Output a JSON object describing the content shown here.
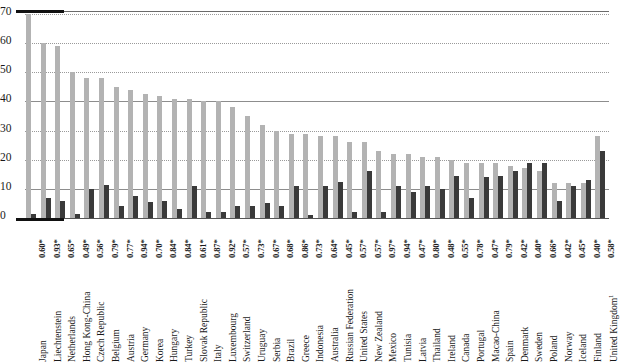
{
  "chart_data": {
    "type": "bar",
    "title": "",
    "xlabel": "",
    "ylabel": "",
    "ylim": [
      0,
      80
    ],
    "yticks": [
      0,
      10,
      20,
      30,
      40,
      50,
      60,
      70,
      80
    ],
    "grid": true,
    "legend_position": "none",
    "colors": {
      "light_series": "#b3b3b3",
      "dark_series": "#3a3a3a"
    },
    "categories": [
      "Japan",
      "Liechtenstein",
      "Netherlands",
      "Hong Kong-China",
      "Czech Republic",
      "Belgium",
      "Austria",
      "Germany",
      "Korea",
      "Hungary",
      "Turkey",
      "Slovak Republic",
      "Italy",
      "Luxembourg",
      "Switzerland",
      "Uruguay",
      "Serbia",
      "Brazil",
      "Greece",
      "Indonesia",
      "Australia",
      "Russian Federation",
      "United States",
      "New Zealand",
      "Mexico",
      "Tunisia",
      "Latvia",
      "Thailand",
      "Ireland",
      "Canada",
      "Portugal",
      "Macao-China",
      "Spain",
      "Denmark",
      "Sweden",
      "Poland",
      "Norway",
      "Iceland",
      "Finland",
      "United Kingdom"
    ],
    "category_superscripts": {
      "United Kingdom": "1"
    },
    "secondary_labels": [
      "0.60*",
      "0.93*",
      "0.65*",
      "0.49*",
      "0.56*",
      "0.79*",
      "0.77*",
      "0.94*",
      "0.70*",
      "0.84*",
      "0.84*",
      "0.61*",
      "0.87*",
      "0.92*",
      "0.57*",
      "0.73*",
      "0.67*",
      "0.68*",
      "0.86*",
      "0.73*",
      "0.64*",
      "0.45*",
      "0.57*",
      "0.57*",
      "0.97*",
      "0.94*",
      "0.47*",
      "0.80*",
      "0.48*",
      "0.55*",
      "0.78*",
      "0.47*",
      "0.79*",
      "0.42*",
      "0.40*",
      "0.66*",
      "0.42*",
      "0.45*",
      "0.40*",
      "0.58*"
    ],
    "series": [
      {
        "name": "light-series",
        "color": "#b3b3b3",
        "values": [
          70,
          60,
          59,
          50,
          48,
          48,
          45,
          44,
          42.5,
          42,
          41,
          41,
          40,
          40,
          38,
          35,
          32,
          30,
          29,
          29,
          28,
          28,
          26,
          26,
          23,
          22,
          22,
          21,
          21,
          20,
          19,
          19,
          19,
          18,
          17,
          16,
          12,
          12,
          12,
          28
        ]
      },
      {
        "name": "dark-series",
        "color": "#3a3a3a",
        "values": [
          1.5,
          7,
          6,
          1.5,
          10,
          11.5,
          4,
          7.5,
          5.5,
          6,
          3,
          11,
          2,
          2,
          4,
          4,
          5,
          4,
          11,
          1,
          11,
          12.5,
          2,
          16,
          2,
          11,
          9,
          11,
          10,
          14.5,
          7,
          14,
          14.5,
          16,
          19,
          19,
          6,
          11,
          13,
          23
        ]
      }
    ]
  }
}
